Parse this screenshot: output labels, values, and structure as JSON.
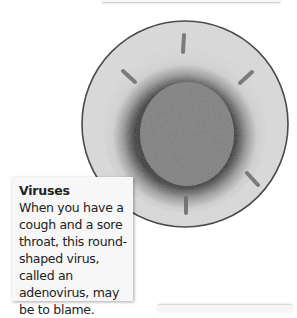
{
  "figure": {
    "colors": {
      "outline": "#4a4a4a",
      "background_disc": "#d9d9d9",
      "halo": "#2e2e2e",
      "core": "#7a7a7a",
      "spikes": "#5a5a5a"
    }
  },
  "caption": {
    "title": "Viruses",
    "body": "When you have a cough and a sore throat, this round-shaped virus, called an adenovirus, may be to blame."
  }
}
